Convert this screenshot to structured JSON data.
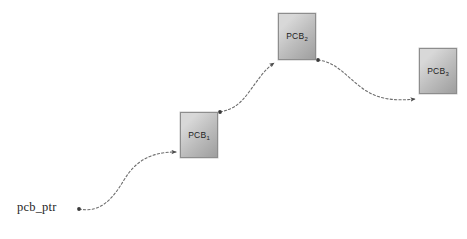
{
  "diagram": {
    "background_color": "#ffffff",
    "pointer": {
      "label": "pcb_ptr",
      "x": 17,
      "y": 200
    },
    "nodes": [
      {
        "id": "pcb1",
        "label_base": "PCB",
        "label_sub": "1",
        "x": 180,
        "y": 112,
        "width": 38,
        "height": 46,
        "fill_light": "#d8d8d8",
        "fill_dark": "#9e9e9e",
        "border_color": "#8d8d8d"
      },
      {
        "id": "pcb2",
        "label_base": "PCB",
        "label_sub": "2",
        "x": 278,
        "y": 13,
        "width": 38,
        "height": 47,
        "fill_light": "#d8d8d8",
        "fill_dark": "#9e9e9e",
        "border_color": "#8d8d8d"
      },
      {
        "id": "pcb3",
        "label_base": "PCB",
        "label_sub": "3",
        "x": 419,
        "y": 48,
        "width": 38,
        "height": 46,
        "fill_light": "#d8d8d8",
        "fill_dark": "#9e9e9e",
        "border_color": "#8d8d8d"
      }
    ],
    "links": [
      {
        "id": "link-ptr-pcb1",
        "from": "pcb_ptr",
        "to": "pcb1",
        "style": "dashed-curve",
        "color": "#6e6e6e",
        "start_dot": true,
        "end_arrow": true,
        "path": "M 79,209 C 100,213 112,200 124,180 C 136,160 152,152 176,152"
      },
      {
        "id": "link-pcb1-pcb2",
        "from": "pcb1",
        "to": "pcb2",
        "style": "dashed-curve",
        "color": "#6e6e6e",
        "start_dot": true,
        "end_arrow": true,
        "path": "M 220,112 C 234,109 240,104 249,92 C 258,80 264,70 274,63"
      },
      {
        "id": "link-pcb2-pcb3",
        "from": "pcb2",
        "to": "pcb3",
        "style": "dashed-curve",
        "color": "#6e6e6e",
        "start_dot": true,
        "end_arrow": true,
        "path": "M 318,60 C 336,62 346,76 362,88 C 378,100 396,101 415,99"
      }
    ]
  }
}
